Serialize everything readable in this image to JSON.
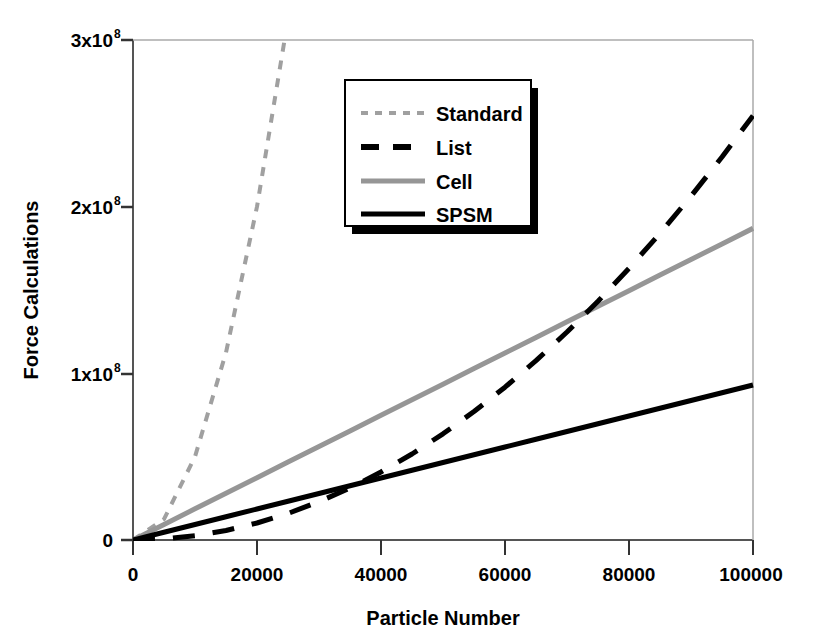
{
  "chart_data": {
    "type": "line",
    "title": "",
    "xlabel": "Particle Number",
    "ylabel": "Force Calculations",
    "xlim": [
      0,
      100000
    ],
    "ylim": [
      0,
      300000000
    ],
    "grid": false,
    "legend_position": "upper-center",
    "x_tick_labels": [
      "0",
      "20000",
      "40000",
      "60000",
      "80000",
      "100000"
    ],
    "x_ticks": [
      0,
      20000,
      40000,
      60000,
      80000,
      100000
    ],
    "y_ticks": [
      0,
      100000000,
      200000000,
      300000000
    ],
    "y_tick_labels": [
      "0",
      "1x10",
      "2x10",
      "3x10"
    ],
    "y_tick_exponents": [
      "",
      "8",
      "8",
      "8"
    ],
    "x": [
      0,
      5000,
      10000,
      15000,
      20000,
      25000,
      30000,
      35000,
      40000,
      45000,
      50000,
      55000,
      60000,
      65000,
      70000,
      75000,
      80000,
      85000,
      90000,
      95000,
      100000
    ],
    "series": [
      {
        "name": "Standard",
        "color": "#a0a0a0",
        "style": "dotted",
        "width": 4,
        "clipped_at_top": true,
        "exit_top_x": 24350,
        "values": [
          0,
          12500000,
          50000000,
          112500000,
          200000000,
          312500000,
          450000000,
          612500000,
          800000000,
          1012500000,
          1250000000,
          1512500000,
          1800000000,
          2112500000,
          2450000000,
          2812500000,
          3200000000,
          3612500000,
          4050000000,
          4512500000,
          5000000000
        ]
      },
      {
        "name": "List",
        "color": "#000000",
        "style": "dashed",
        "width": 5,
        "values": [
          0,
          600000,
          2500000,
          5700000,
          10200000,
          15900000,
          23000000,
          31200000,
          40800000,
          51600000,
          63700000,
          77100000,
          91700000,
          107600000,
          124800000,
          143200000,
          163000000,
          184000000,
          206300000,
          229800000,
          254600000
        ]
      },
      {
        "name": "Cell",
        "color": "#969696",
        "style": "solid",
        "width": 5,
        "values": [
          0,
          9350000,
          18700000,
          28050000,
          37400000,
          46750000,
          56100000,
          65450000,
          74800000,
          84150000,
          93500000,
          102850000,
          112200000,
          121550000,
          130900000,
          140250000,
          149600000,
          158950000,
          168300000,
          177650000,
          187000000
        ]
      },
      {
        "name": "SPSM",
        "color": "#000000",
        "style": "solid",
        "width": 5,
        "values": [
          0,
          4650000,
          9300000,
          13950000,
          18600000,
          23250000,
          27900000,
          32550000,
          37200000,
          41850000,
          46500000,
          51150000,
          55800000,
          60450000,
          65100000,
          69750000,
          74400000,
          79050000,
          83700000,
          88350000,
          93000000
        ]
      }
    ],
    "annotations": {
      "list_crosses_spsm_at_x": 42000,
      "list_crosses_cell_at_x": 75000
    }
  },
  "legend": {
    "entries": [
      {
        "label": "Standard"
      },
      {
        "label": "List"
      },
      {
        "label": "Cell"
      },
      {
        "label": "SPSM"
      }
    ]
  },
  "axes": {
    "x_title": "Particle Number",
    "y_title": "Force Calculations"
  },
  "colors": {
    "background": "#ffffff",
    "axis": "#555555",
    "gray_series": "#969696",
    "light_gray_series": "#a0a0a0",
    "black_series": "#000000",
    "legend_shadow": "#000000"
  }
}
